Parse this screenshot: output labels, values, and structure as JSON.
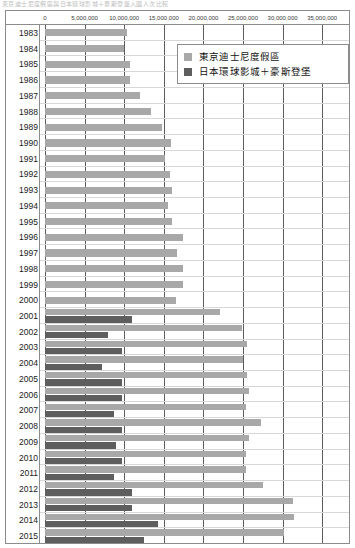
{
  "top_strip_text": "東京迪士尼度假區與日本環球影城＋豪斯登堡入園人次比較",
  "legend": {
    "items": [
      {
        "label": "東京迪士尼度假區",
        "color": "#a8a8a8",
        "key": "tokyo_disney_resort"
      },
      {
        "label": "日本環球影城＋豪斯登堡",
        "color": "#5e5e5e",
        "key": "usj_huis_ten_bosch"
      }
    ]
  },
  "chart_data": {
    "type": "bar",
    "orientation": "horizontal",
    "title": "",
    "xlabel": "",
    "ylabel": "",
    "xlim": [
      0,
      37000000
    ],
    "axis_max_tick": 35000000,
    "grid": true,
    "legend_position": "top-right",
    "tick_labels": [
      "0",
      "5,000,000",
      "10,000,000",
      "15,000,000",
      "20,000,000",
      "25,000,000",
      "30,000,000",
      "35,000,000"
    ],
    "tick_values": [
      0,
      5000000,
      10000000,
      15000000,
      20000000,
      25000000,
      30000000,
      35000000
    ],
    "categories": [
      "1983",
      "1984",
      "1985",
      "1986",
      "1987",
      "1988",
      "1989",
      "1990",
      "1991",
      "1992",
      "1993",
      "1994",
      "1995",
      "1996",
      "1997",
      "1998",
      "1999",
      "2000",
      "2001",
      "2002",
      "2003",
      "2004",
      "2005",
      "2006",
      "2007",
      "2008",
      "2009",
      "2010",
      "2011",
      "2012",
      "2013",
      "2014",
      "2015"
    ],
    "series": [
      {
        "name": "東京迪士尼度假區",
        "color": "#a8a8a8",
        "values": [
          10360000,
          10010000,
          10670000,
          10670000,
          11980000,
          13380000,
          14750000,
          15880000,
          15180000,
          15820000,
          16030000,
          15510000,
          16030000,
          17370000,
          16690000,
          17460000,
          17460000,
          16510000,
          22050000,
          24820000,
          25470000,
          25020000,
          25470000,
          25820000,
          25370000,
          27220000,
          25820000,
          25370000,
          25370000,
          27500000,
          31290000,
          31380000,
          30190000
        ]
      },
      {
        "name": "日本環球影城＋豪斯登堡",
        "color": "#5e5e5e",
        "values": [
          0,
          0,
          0,
          0,
          0,
          0,
          0,
          0,
          0,
          0,
          0,
          0,
          0,
          0,
          0,
          0,
          0,
          0,
          11000000,
          8000000,
          9750000,
          7250000,
          9750000,
          9750000,
          8750000,
          9750000,
          9000000,
          9750000,
          8750000,
          11000000,
          11000000,
          14250000,
          12500000
        ]
      }
    ]
  }
}
